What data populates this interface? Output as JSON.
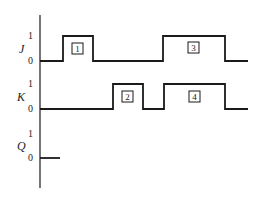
{
  "diagram": {
    "type": "timing-diagram",
    "signals": [
      {
        "name": "J",
        "high_label": "1",
        "low_label": "0",
        "pulses": [
          {
            "label": "1"
          },
          {
            "label": "3"
          }
        ]
      },
      {
        "name": "K",
        "high_label": "1",
        "low_label": "0",
        "pulses": [
          {
            "label": "2"
          },
          {
            "label": "4"
          }
        ]
      },
      {
        "name": "Q",
        "high_label": "1",
        "low_label": "0",
        "pulses": []
      }
    ],
    "colors": {
      "line": "#1a1a1a",
      "text": "#222222"
    }
  }
}
